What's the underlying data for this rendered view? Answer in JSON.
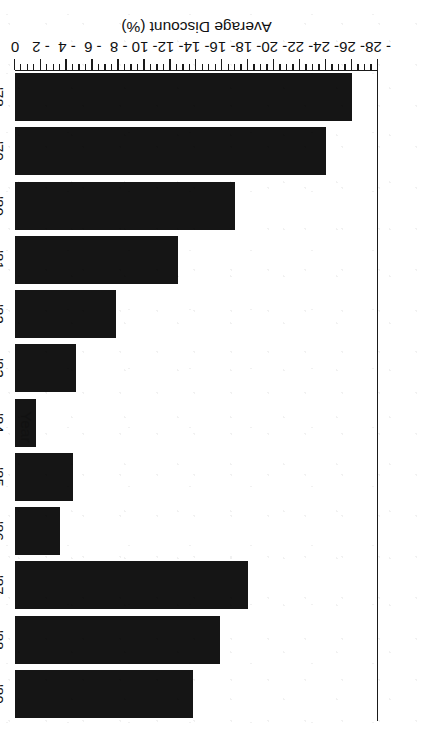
{
  "chart_data": {
    "type": "bar",
    "orientation": "horizontal",
    "title": "",
    "subtitle": "",
    "xlabel": "Average Discount (%)",
    "ylabel": "Year",
    "categories": [
      "'78",
      "'79",
      "'80",
      "'81",
      "'82",
      "'83",
      "'84",
      "'85",
      "'86",
      "'87",
      "'88",
      "'89"
    ],
    "values": [
      -26.0,
      -24.0,
      -17.0,
      -12.6,
      -7.8,
      -4.7,
      -1.6,
      -4.5,
      -3.5,
      -18.0,
      -15.8,
      -13.7
    ],
    "series": [
      {
        "name": "Average Discount",
        "values": [
          -26.0,
          -24.0,
          -17.0,
          -12.6,
          -7.8,
          -4.7,
          -1.6,
          -4.5,
          -3.5,
          -18.0,
          -15.8,
          -13.7
        ]
      }
    ],
    "xlim": [
      -28,
      0
    ],
    "ylim": null,
    "xticks": [
      -28,
      -26,
      -24,
      -22,
      -20,
      -18,
      -16,
      -14,
      -12,
      -10,
      -8,
      -6,
      -4,
      -2,
      0
    ],
    "xticklabels": [
      "- 28",
      "- 26",
      "- 24",
      "- 22",
      "- 20",
      "- 18",
      "- 16",
      "- 14",
      "- 12",
      "- 10",
      "- 8",
      "- 6",
      "- 4",
      "- 2",
      "0"
    ],
    "minor_ticks": true,
    "grid": false,
    "legend": null,
    "legend_position": "none",
    "bar_color": "#151515",
    "axis_color": "#1a1a1a",
    "background": "#ffffff",
    "page_rotation_degrees": 180,
    "annotations": []
  },
  "figure": {
    "value_axis_title": "Average Discount (%)",
    "category_axis_title": "Year"
  }
}
